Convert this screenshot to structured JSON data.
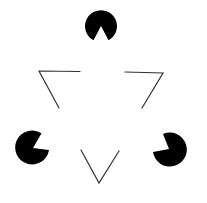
{
  "figure": {
    "background_color": "#ffffff",
    "ink_color": "#000000",
    "line_color": "#333333",
    "inducers": [
      {
        "name": "top",
        "notch_direction": "down"
      },
      {
        "name": "bottom-left",
        "notch_direction": "up-right"
      },
      {
        "name": "bottom-right",
        "notch_direction": "up-left"
      }
    ],
    "outline_triangle": {
      "orientation": "pointing-down",
      "corners": [
        "top-left",
        "top-right",
        "bottom"
      ]
    }
  }
}
